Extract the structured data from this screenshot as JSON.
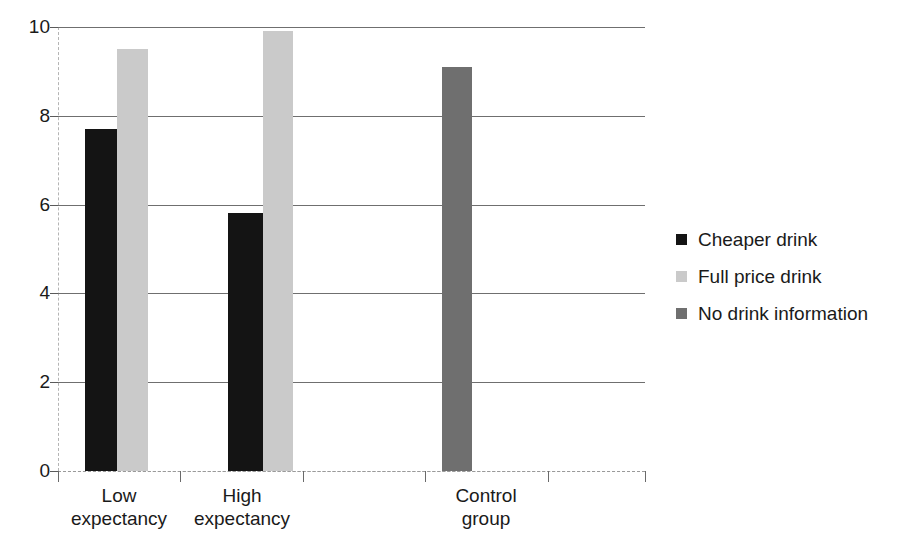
{
  "chart_data": {
    "type": "bar",
    "title": "",
    "subtitle": "",
    "xlabel": "",
    "ylabel": "",
    "ylim": [
      0,
      10
    ],
    "yticks": [
      0,
      2,
      4,
      6,
      8,
      10
    ],
    "ytick_labels": [
      "0",
      "2",
      "4",
      "6",
      "8",
      "10"
    ],
    "grid": true,
    "legend_position": "right",
    "categories": [
      "Low\nexpectancy",
      "High\nexpectancy",
      "Control\ngroup"
    ],
    "category_labels_flat": [
      "Low expectancy",
      "High expectancy",
      "Control group"
    ],
    "series": [
      {
        "name": "Cheaper drink",
        "color": "#141414",
        "values": [
          7.7,
          5.8,
          null
        ]
      },
      {
        "name": "Full price drink",
        "color": "#cacaca",
        "values": [
          9.5,
          9.9,
          null
        ]
      },
      {
        "name": "No drink information",
        "color": "#6f6f6f",
        "values": [
          null,
          null,
          9.1
        ]
      }
    ]
  },
  "legend": {
    "items": [
      {
        "label": "Cheaper drink",
        "swatch_class": "cheaper",
        "swatch_name": "legend-swatch-cheaper-drink"
      },
      {
        "label": "Full price drink",
        "swatch_class": "fullprice",
        "swatch_name": "legend-swatch-full-price-drink"
      },
      {
        "label": "No drink information",
        "swatch_class": "noinfo",
        "swatch_name": "legend-swatch-no-drink-information"
      }
    ]
  },
  "colors": {
    "cheaper_drink": "#141414",
    "full_price_drink": "#cacaca",
    "no_drink_information": "#6f6f6f",
    "gridline": "#6f6f6f",
    "axis": "#9a9a9a",
    "text": "#1a1a1a",
    "background": "#ffffff"
  }
}
